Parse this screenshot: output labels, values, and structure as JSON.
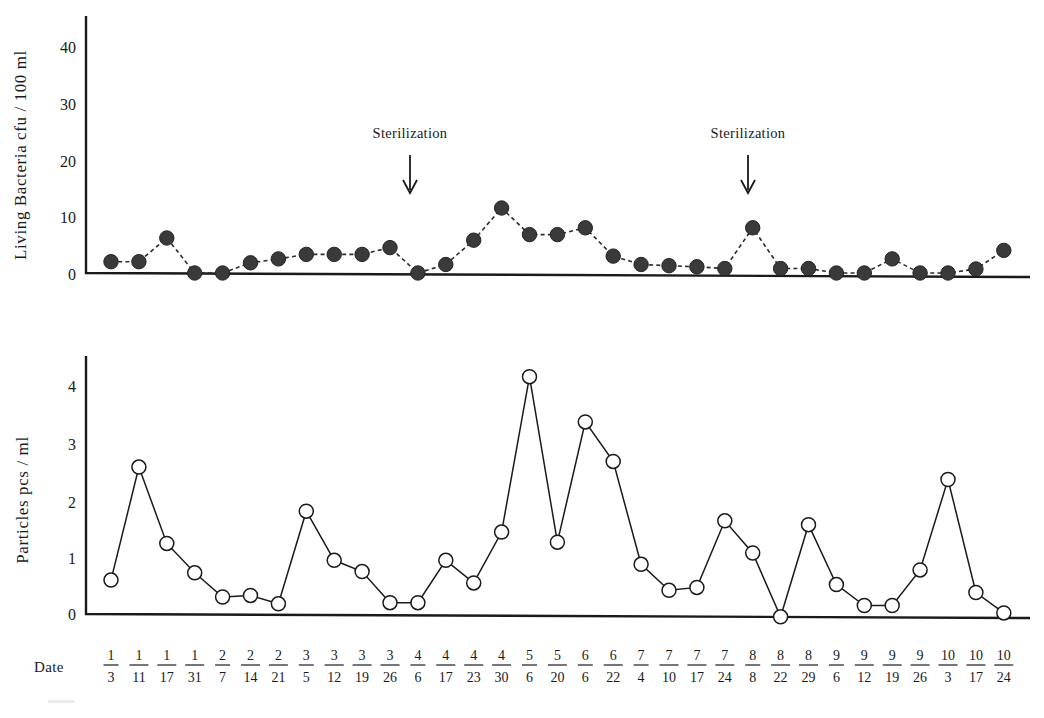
{
  "figure": {
    "title": "",
    "background_color": "#ffffff",
    "ink_color": "#1a1a1a"
  },
  "dates": {
    "axis_word": "Date",
    "labels": [
      {
        "month": "1",
        "day": "3"
      },
      {
        "month": "1",
        "day": "11"
      },
      {
        "month": "1",
        "day": "17"
      },
      {
        "month": "1",
        "day": "31"
      },
      {
        "month": "2",
        "day": "7"
      },
      {
        "month": "2",
        "day": "14"
      },
      {
        "month": "2",
        "day": "21"
      },
      {
        "month": "3",
        "day": "5"
      },
      {
        "month": "3",
        "day": "12"
      },
      {
        "month": "3",
        "day": "19"
      },
      {
        "month": "3",
        "day": "26"
      },
      {
        "month": "4",
        "day": "6"
      },
      {
        "month": "4",
        "day": "17"
      },
      {
        "month": "4",
        "day": "23"
      },
      {
        "month": "4",
        "day": "30"
      },
      {
        "month": "5",
        "day": "6"
      },
      {
        "month": "5",
        "day": "20"
      },
      {
        "month": "6",
        "day": "6"
      },
      {
        "month": "6",
        "day": "22"
      },
      {
        "month": "7",
        "day": "4"
      },
      {
        "month": "7",
        "day": "10"
      },
      {
        "month": "7",
        "day": "17"
      },
      {
        "month": "7",
        "day": "24"
      },
      {
        "month": "8",
        "day": "8"
      },
      {
        "month": "8",
        "day": "22"
      },
      {
        "month": "8",
        "day": "29"
      },
      {
        "month": "9",
        "day": "6"
      },
      {
        "month": "9",
        "day": "12"
      },
      {
        "month": "9",
        "day": "19"
      },
      {
        "month": "9",
        "day": "26"
      },
      {
        "month": "10",
        "day": "3"
      },
      {
        "month": "10",
        "day": "17"
      },
      {
        "month": "10",
        "day": "24"
      }
    ]
  },
  "annotations": [
    {
      "text": "Sterilization",
      "at_date": "4/6",
      "arrow": "down-arrow"
    },
    {
      "text": "Sterilization",
      "at_date": "8/8",
      "arrow": "down-arrow"
    }
  ],
  "chart_data": [
    {
      "type": "line",
      "id": "living-bacteria",
      "title": "",
      "xlabel": "Date",
      "ylabel": "Living Bacteria cfu / 100 ml",
      "ylim": [
        0,
        45
      ],
      "yticks": [
        0,
        10,
        20,
        30,
        40
      ],
      "ytick_labels": [
        "0",
        "10",
        "20",
        "30",
        "40"
      ],
      "grid": false,
      "legend": "none",
      "marker": "filled-circle",
      "linestyle": "dashed",
      "categories": [
        "1/3",
        "1/11",
        "1/17",
        "1/31",
        "2/7",
        "2/14",
        "2/21",
        "3/5",
        "3/12",
        "3/19",
        "3/26",
        "4/6",
        "4/17",
        "4/23",
        "4/30",
        "5/6",
        "5/20",
        "6/6",
        "6/22",
        "7/4",
        "7/10",
        "7/17",
        "7/24",
        "8/8",
        "8/22",
        "8/29",
        "9/6",
        "9/12",
        "9/19",
        "9/26",
        "10/3",
        "10/17",
        "10/24"
      ],
      "values": [
        2.0,
        2.0,
        6.2,
        0.0,
        0.0,
        1.8,
        2.5,
        3.3,
        3.3,
        3.3,
        4.5,
        0.0,
        1.5,
        5.8,
        11.5,
        6.8,
        6.8,
        8.0,
        3.0,
        1.5,
        1.3,
        1.1,
        0.8,
        8.0,
        0.8,
        0.8,
        0.0,
        0.0,
        2.5,
        0.0,
        0.0,
        0.7,
        4.0
      ]
    },
    {
      "type": "line",
      "id": "particles",
      "title": "",
      "xlabel": "Date",
      "ylabel": "Particles pcs / ml",
      "ylim": [
        0,
        4.4
      ],
      "yticks": [
        0,
        1,
        2,
        3,
        4
      ],
      "ytick_labels": [
        "0",
        "1",
        "2",
        "3",
        "4"
      ],
      "grid": false,
      "legend": "none",
      "marker": "open-circle",
      "linestyle": "solid",
      "categories": [
        "1/3",
        "1/11",
        "1/17",
        "1/31",
        "2/7",
        "2/14",
        "2/21",
        "3/5",
        "3/12",
        "3/19",
        "3/26",
        "4/6",
        "4/17",
        "4/23",
        "4/30",
        "5/6",
        "5/20",
        "6/6",
        "6/22",
        "7/4",
        "7/10",
        "7/17",
        "7/24",
        "8/8",
        "8/22",
        "8/29",
        "9/6",
        "9/12",
        "9/19",
        "9/26",
        "10/3",
        "10/17",
        "10/24"
      ],
      "values": [
        0.6,
        2.6,
        1.25,
        0.73,
        0.3,
        0.33,
        0.18,
        1.82,
        0.95,
        0.75,
        0.2,
        0.2,
        0.95,
        0.55,
        1.45,
        4.2,
        1.27,
        3.4,
        2.7,
        0.88,
        0.42,
        0.47,
        1.65,
        1.08,
        -0.05,
        1.58,
        0.52,
        0.15,
        0.15,
        0.78,
        2.38,
        0.38,
        0.02
      ]
    }
  ]
}
